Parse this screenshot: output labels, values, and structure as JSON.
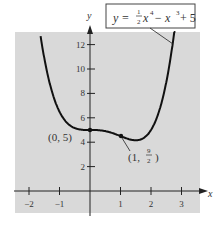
{
  "chart_data": {
    "type": "line",
    "title": "",
    "equation_label": "y = ½x⁴ − x³ + 5",
    "function": "y = 0.5*x^4 - x^3 + 5",
    "xlabel": "x",
    "ylabel": "y",
    "xlim": [
      -2.4,
      3.5
    ],
    "ylim": [
      -1.8,
      13
    ],
    "x_ticks": [
      -2,
      -1,
      1,
      2,
      3
    ],
    "y_ticks": [
      2,
      4,
      6,
      8,
      10,
      12
    ],
    "x_tick_labels": [
      "−2",
      "−1",
      "1",
      "2",
      "3"
    ],
    "y_tick_labels": [
      "2",
      "4",
      "6",
      "8",
      "10",
      "12"
    ],
    "grid": false,
    "background": "#d9d9d9",
    "line_color": "#111111",
    "points": [
      {
        "x": -1.6,
        "y": 13.1
      },
      {
        "x": -1.5,
        "y": 11.9
      },
      {
        "x": -1.0,
        "y": 6.5
      },
      {
        "x": -0.5,
        "y": 5.16
      },
      {
        "x": 0,
        "y": 5,
        "label": "(0, 5)",
        "marked": true
      },
      {
        "x": 0.5,
        "y": 4.91
      },
      {
        "x": 1,
        "y": 4.5,
        "label": "(1, 9/2)",
        "marked": true
      },
      {
        "x": 1.5,
        "y": 3.97
      },
      {
        "x": 2,
        "y": 5
      },
      {
        "x": 2.5,
        "y": 9.9
      },
      {
        "x": 2.8,
        "y": 12.2
      }
    ],
    "annotations": [
      {
        "text": "(0, 5)",
        "x": 0,
        "y": 5
      },
      {
        "text": "(1, 9/2)",
        "x": 1,
        "y": 4.5
      }
    ]
  },
  "labels": {
    "y_axis": "y",
    "x_axis": "x",
    "eq_y": "y = ",
    "eq_half_num": "1",
    "eq_half_den": "2",
    "eq_x4": "x",
    "eq_exp4": "4",
    "eq_minus": " − x",
    "eq_exp3": "3",
    "eq_plus": "+ 5",
    "pt0": "(0, 5)",
    "pt1_open": "(1, ",
    "pt1_num": "9",
    "pt1_den": "2",
    "pt1_close": ")"
  }
}
